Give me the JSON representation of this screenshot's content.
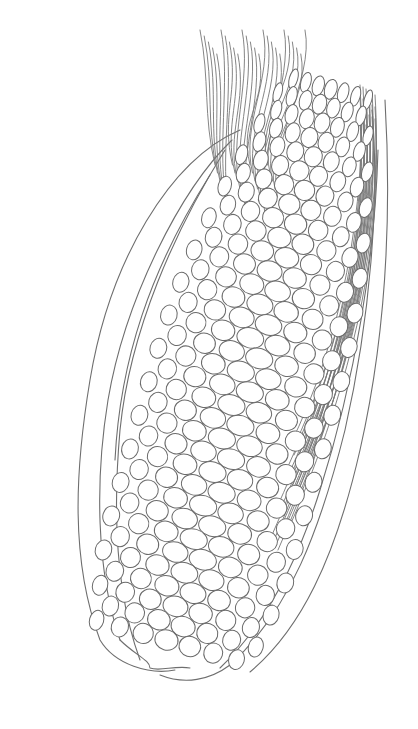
{
  "image": {
    "subject": "corn-cob-line-drawing",
    "background_color": "#ffffff",
    "line_color": "#6e6e6e",
    "kernel_rows": 34,
    "kernels_per_row": 7
  }
}
